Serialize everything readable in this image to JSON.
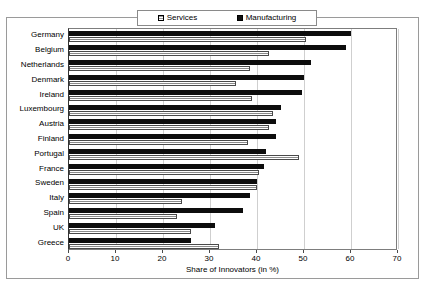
{
  "chart_data": {
    "type": "bar",
    "orientation": "horizontal",
    "title": "",
    "xlabel": "Share of Innovators (in %)",
    "ylabel": "",
    "xlim": [
      0,
      70
    ],
    "xticks": [
      0,
      10,
      20,
      30,
      40,
      50,
      60,
      70
    ],
    "grid": true,
    "legend_position": "top",
    "categories": [
      "Germany",
      "Belgium",
      "Netherlands",
      "Denmark",
      "Ireland",
      "Luxembourg",
      "Austria",
      "Finland",
      "Portugal",
      "France",
      "Sweden",
      "Italy",
      "Spain",
      "UK",
      "Greece"
    ],
    "series": [
      {
        "name": "Services",
        "color": "#c9c9c9",
        "values": [
          50.5,
          42.5,
          38.5,
          35.5,
          39.0,
          43.5,
          42.5,
          38.0,
          49.0,
          40.5,
          40.0,
          24.0,
          23.0,
          26.0,
          32.0
        ]
      },
      {
        "name": "Manufacturing",
        "color": "#0d0d0d",
        "values": [
          60.0,
          59.0,
          51.5,
          50.0,
          49.5,
          45.0,
          44.0,
          44.0,
          42.0,
          41.5,
          40.0,
          38.5,
          37.0,
          31.0,
          26.0
        ]
      }
    ]
  },
  "legend": {
    "items": [
      {
        "label": "Services",
        "swatch": "services-swatch-icon"
      },
      {
        "label": "Manufacturing",
        "swatch": "manufacturing-swatch-icon"
      }
    ]
  },
  "axis": {
    "x_title": "Share of Innovators (in %)",
    "x_tick_labels": [
      "0",
      "10",
      "20",
      "30",
      "40",
      "50",
      "60",
      "70"
    ]
  }
}
